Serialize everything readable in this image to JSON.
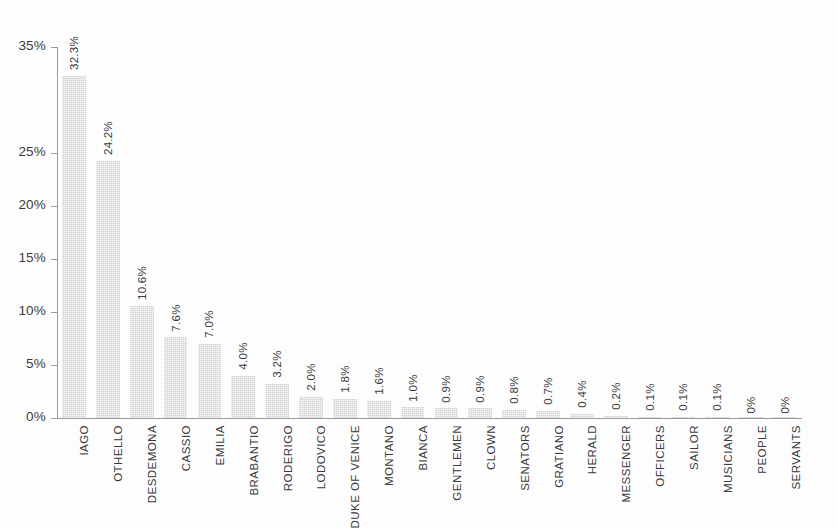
{
  "chart_data": {
    "type": "bar",
    "title": "",
    "subtitle": "",
    "xlabel": "",
    "ylabel": "",
    "ylim": [
      0,
      35
    ],
    "grid": false,
    "legend": "none",
    "orientation": "vertical",
    "bar_color": "#d2d2d2",
    "axis_color": "#9a9a9a",
    "background": "#fdfdfd",
    "y_ticks": [
      {
        "value": 0,
        "label": "0%"
      },
      {
        "value": 5,
        "label": "5%"
      },
      {
        "value": 10,
        "label": "10%"
      },
      {
        "value": 15,
        "label": "15%"
      },
      {
        "value": 20,
        "label": "20%"
      },
      {
        "value": 25,
        "label": "25%"
      },
      {
        "value": 35,
        "label": "35%"
      }
    ],
    "categories": [
      "IAGO",
      "OTHELLO",
      "DESDEMONA",
      "CASSIO",
      "EMILIA",
      "BRABANTIO",
      "RODERIGO",
      "LODOVICO",
      "DUKE OF VENICE",
      "MONTANO",
      "BIANCA",
      "GENTLEMEN",
      "CLOWN",
      "SENATORS",
      "GRATIANO",
      "HERALD",
      "MESSENGER",
      "OFFICERS",
      "SAILOR",
      "MUSICIANS",
      "PEOPLE",
      "SERVANTS"
    ],
    "values": [
      32.3,
      24.2,
      10.6,
      7.6,
      7.0,
      4.0,
      3.2,
      2.0,
      1.8,
      1.6,
      1.0,
      0.9,
      0.9,
      0.8,
      0.7,
      0.4,
      0.2,
      0.1,
      0.1,
      0.1,
      0.0,
      0.0
    ],
    "data_labels": [
      "32.3%",
      "24.2%",
      "10.6%",
      "7.6%",
      "7.0%",
      "4.0%",
      "3.2%",
      "2.0%",
      "1.8%",
      "1.6%",
      "1.0%",
      "0.9%",
      "0.9%",
      "0.8%",
      "0.7%",
      "0.4%",
      "0.2%",
      "0.1%",
      "0.1%",
      "0.1%",
      "0%",
      "0%"
    ]
  }
}
